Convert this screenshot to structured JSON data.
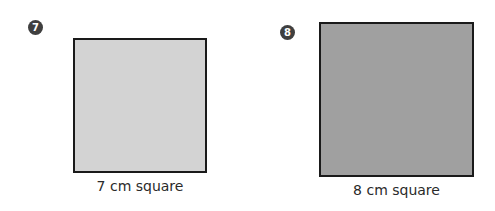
{
  "problems": [
    {
      "number": "7",
      "label": "7 cm square",
      "fill_color": "#d3d3d3",
      "border_color": "#1a1a1a"
    },
    {
      "number": "8",
      "label": "8 cm square",
      "fill_color": "#a0a0a0",
      "border_color": "#1a1a1a"
    }
  ]
}
